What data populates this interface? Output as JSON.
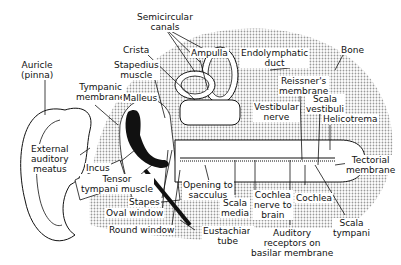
{
  "labels": {
    "auricle": "Auricle\n(pinna)",
    "semicircular_canals": "Semicircular\ncanals",
    "crista": "Crista",
    "stapedius_muscle": "Stapedius\nmuscle",
    "ampulla": "Ampulla",
    "endolymphatic_duct": "Endolymphatic\nduct",
    "bone": "Bone",
    "tympanic_membrane": "Tympanic\nmembrane",
    "malleus": "Malleus",
    "reissners_membrane": "Reissner's\nmembrane",
    "vestibular_nerve": "Vestibular\nnerve",
    "scala_vestibuli": "Scala\nvestibuli",
    "helicotrema": "Helicotrema",
    "external_auditory_meatus": "External\nauditory\nmeatus",
    "incus": "Incus",
    "tensor_tympani_muscle": "Tensor\ntympani muscle",
    "tectorial_membrane": "Tectorial\nmembrane",
    "stapes": "Stapes",
    "opening_to_sacculus": "Opening to\nsacculus",
    "oval_window": "Oval window",
    "scala_media": "Scala\nmedia",
    "cochlea_nerve": "Cochlea\nnerve to\nbrain",
    "cochlea": "Cochlea",
    "round_window": "Round window",
    "eustachian_tube": "Eustachian\ntube",
    "auditory_receptors": "Auditory\nreceptors on\nbasilar membrane",
    "scala_tympani": "Scala\ntympani"
  },
  "colors": {
    "ink": "#111111",
    "stipple": "#bdbdbd",
    "paper": "#ffffff"
  }
}
